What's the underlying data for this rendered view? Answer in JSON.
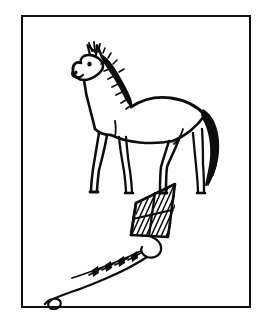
{
  "page": {
    "background_color": "#ffffff",
    "width": 272,
    "height": 321,
    "medium": "black-ink-line-drawing",
    "caption": ""
  },
  "frame": {
    "name": "picture-border",
    "border_color": "#111111",
    "border_width": 2,
    "fill_color": "#ffffff"
  },
  "illustrations": [
    {
      "id": "horse",
      "label": "horse",
      "description": "Hand-drawn horse standing in profile facing left, with a solid black spiky mane and a thick black tail.",
      "ink_color": "#0d0d0d",
      "position": "upper-center",
      "parts": [
        "ears",
        "eye",
        "muzzle",
        "nostril",
        "mane",
        "neck",
        "back",
        "barrel",
        "rump",
        "tail",
        "front-legs",
        "hind-legs",
        "hooves"
      ]
    },
    {
      "id": "kite",
      "label": "kite",
      "description": "Diamond kite tilted with cross spars, diagonal hatching shading in two panels, a trailing string with four bow-tie ribbons and a long S-curved tail line.",
      "ink_color": "#0d0d0d",
      "position": "lower-center",
      "ribbon_count": 4,
      "parts": [
        "kite-sail",
        "vertical-spar",
        "horizontal-spar",
        "hatching",
        "bridle-loop",
        "tail-string",
        "ribbons"
      ]
    }
  ]
}
